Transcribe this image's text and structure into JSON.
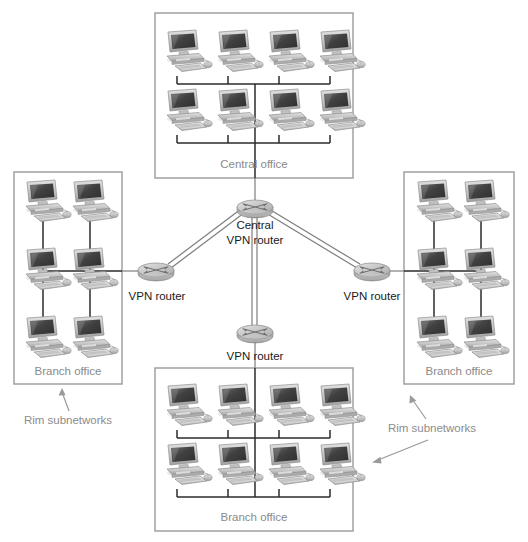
{
  "diagram": {
    "canvas": {
      "width": 528,
      "height": 542
    },
    "colors": {
      "background": "#ffffff",
      "box_border": "#9a9a9a",
      "lan_line": "#2b2b2b",
      "wan_line": "#7d7d7d",
      "office_label": "#8a8a8a",
      "router_label": "#1a1a1a",
      "annotation_label": "#8c8c8c",
      "monitor_screen": "#4a4a4a",
      "device_body": "#c9c9c9",
      "router_top": "#c4c4c4",
      "router_side": "#a8a8a8"
    },
    "offices": [
      {
        "id": "central-office",
        "label": "Central office",
        "position": "top",
        "computer_count": 8,
        "grid": {
          "cols": 4,
          "rows": 2
        },
        "box": {
          "x": 155,
          "y": 13,
          "width": 198,
          "height": 165
        },
        "label_pos": {
          "x": 254,
          "y": 165
        }
      },
      {
        "id": "branch-office-left",
        "label": "Branch office",
        "position": "left",
        "computer_count": 6,
        "grid": {
          "cols": 2,
          "rows": 3
        },
        "box": {
          "x": 14,
          "y": 172,
          "width": 108,
          "height": 212
        },
        "label_pos": {
          "x": 68,
          "y": 372
        }
      },
      {
        "id": "branch-office-right",
        "label": "Branch office",
        "position": "right",
        "computer_count": 6,
        "grid": {
          "cols": 2,
          "rows": 3
        },
        "box": {
          "x": 404,
          "y": 172,
          "width": 110,
          "height": 212
        },
        "label_pos": {
          "x": 459,
          "y": 372
        }
      },
      {
        "id": "branch-office-bottom",
        "label": "Branch office",
        "position": "bottom",
        "computer_count": 8,
        "grid": {
          "cols": 4,
          "rows": 2
        },
        "box": {
          "x": 155,
          "y": 368,
          "width": 198,
          "height": 163
        },
        "label_pos": {
          "x": 254,
          "y": 518
        }
      }
    ],
    "routers": [
      {
        "id": "central-vpn-router",
        "label_line_1": "Central",
        "label_line_2": "VPN router",
        "label": "Central VPN router",
        "center": {
          "x": 255,
          "y": 208
        },
        "label_pos": {
          "x": 255,
          "y": 232
        }
      },
      {
        "id": "vpn-router-left",
        "label": "VPN router",
        "center": {
          "x": 156,
          "y": 271
        },
        "label_pos": {
          "x": 157,
          "y": 297
        }
      },
      {
        "id": "vpn-router-right",
        "label": "VPN router",
        "center": {
          "x": 372,
          "y": 271
        },
        "label_pos": {
          "x": 372,
          "y": 297
        }
      },
      {
        "id": "vpn-router-bottom",
        "label": "VPN router",
        "center": {
          "x": 255,
          "y": 333
        },
        "label_pos": {
          "x": 255,
          "y": 357
        }
      }
    ],
    "annotations": [
      {
        "id": "rim-subnetworks-left",
        "label": "Rim subnetworks",
        "label_pos": {
          "x": 68,
          "y": 421
        },
        "arrow": {
          "x1": 69,
          "y1": 411,
          "x2": 62,
          "y2": 390
        }
      },
      {
        "id": "rim-subnetworks-right",
        "label": "Rim subnetworks",
        "label_pos": {
          "x": 432,
          "y": 429
        },
        "arrow": {
          "x1": 424,
          "y1": 418,
          "x2": 411,
          "y2": 397
        },
        "arrow2": {
          "x1": 432,
          "y1": 440,
          "x2": 372,
          "y2": 462
        }
      }
    ],
    "links": [
      {
        "id": "link-central-office-to-central-router",
        "from": "central-office",
        "to": "central-vpn-router",
        "style": "single"
      },
      {
        "id": "link-left-router-to-central-router",
        "from": "vpn-router-left",
        "to": "central-vpn-router",
        "style": "double"
      },
      {
        "id": "link-right-router-to-central-router",
        "from": "vpn-router-right",
        "to": "central-vpn-router",
        "style": "double"
      },
      {
        "id": "link-bottom-router-to-central-router",
        "from": "vpn-router-bottom",
        "to": "central-vpn-router",
        "style": "double"
      },
      {
        "id": "link-left-office-to-left-router",
        "from": "branch-office-left",
        "to": "vpn-router-left",
        "style": "single"
      },
      {
        "id": "link-right-office-to-right-router",
        "from": "branch-office-right",
        "to": "vpn-router-right",
        "style": "single"
      },
      {
        "id": "link-bottom-office-to-bottom-router",
        "from": "branch-office-bottom",
        "to": "vpn-router-bottom",
        "style": "single"
      }
    ]
  }
}
